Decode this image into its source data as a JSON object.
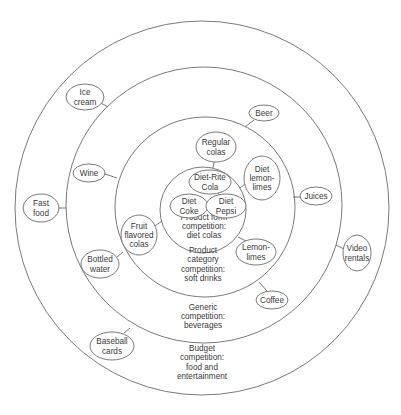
{
  "diagram": {
    "colors": {
      "line": "#6b6b6b",
      "text": "#3a3a3a",
      "background": "#ffffff"
    },
    "rings": [
      {
        "id": "budget",
        "cx": 202,
        "cy": 208,
        "r": 187,
        "label_lines": [
          "Budget",
          "competition:",
          "food and",
          "entertainment"
        ],
        "label_x": 202,
        "label_y": 362
      },
      {
        "id": "generic",
        "cx": 204,
        "cy": 205,
        "r": 138,
        "label_lines": [
          "Generic",
          "competition:",
          "beverages"
        ],
        "label_x": 203,
        "label_y": 316
      },
      {
        "id": "product-category",
        "cx": 205,
        "cy": 207,
        "r": 90,
        "label_lines": [
          "Product",
          "category",
          "competition:",
          "soft drinks"
        ],
        "label_x": 203,
        "label_y": 264
      },
      {
        "id": "product-form",
        "cx": 203,
        "cy": 210,
        "r": 43,
        "label_lines": [
          "Product form",
          "competition:",
          "diet colas"
        ],
        "label_x": 204,
        "label_y": 226
      }
    ],
    "nodes": [
      {
        "id": "ice-cream",
        "lines": [
          "Ice",
          "cream"
        ],
        "cx": 85,
        "cy": 97,
        "rx": 19,
        "ry": 13,
        "link": [
          101,
          103,
          108,
          107
        ]
      },
      {
        "id": "wine",
        "lines": [
          "Wine"
        ],
        "cx": 89,
        "cy": 173,
        "rx": 16,
        "ry": 9,
        "link": [
          105,
          174,
          117,
          178
        ]
      },
      {
        "id": "fast-food",
        "lines": [
          "Fast",
          "food"
        ],
        "cx": 41,
        "cy": 208,
        "rx": 18,
        "ry": 14,
        "link": [
          59,
          208,
          66,
          208
        ]
      },
      {
        "id": "beer",
        "lines": [
          "Beer"
        ],
        "cx": 264,
        "cy": 113,
        "rx": 15,
        "ry": 8,
        "link": [
          254,
          120,
          245,
          127
        ]
      },
      {
        "id": "regular-colas",
        "lines": [
          "Regular",
          "colas"
        ],
        "cx": 216,
        "cy": 147,
        "rx": 20,
        "ry": 15,
        "link": [
          214,
          162,
          213,
          168
        ]
      },
      {
        "id": "diet-lemon-limes",
        "lines": [
          "Diet",
          "lemon-",
          "limes"
        ],
        "cx": 262,
        "cy": 178,
        "rx": 18,
        "ry": 22,
        "link": [
          245,
          184,
          240,
          188
        ]
      },
      {
        "id": "juices",
        "lines": [
          "Juices"
        ],
        "cx": 316,
        "cy": 196,
        "rx": 16,
        "ry": 9,
        "link": [
          300,
          197,
          293,
          197
        ]
      },
      {
        "id": "diet-rite-cola",
        "lines": [
          "Diet-Rite",
          "Cola"
        ],
        "cx": 210,
        "cy": 182,
        "rx": 21,
        "ry": 12,
        "link": null
      },
      {
        "id": "diet-coke",
        "lines": [
          "Diet",
          "Coke"
        ],
        "cx": 189,
        "cy": 206,
        "rx": 19,
        "ry": 12,
        "link": [
          208,
          206,
          206,
          206
        ]
      },
      {
        "id": "diet-pepsi",
        "lines": [
          "Diet",
          "Pepsi"
        ],
        "cx": 226,
        "cy": 206,
        "rx": 20,
        "ry": 12,
        "link": [
          218,
          194,
          221,
          195
        ]
      },
      {
        "id": "fruit-flavored-colas",
        "lines": [
          "Fruit",
          "flavored",
          "colas"
        ],
        "cx": 139,
        "cy": 235,
        "rx": 18,
        "ry": 20,
        "link": [
          155,
          226,
          162,
          221
        ]
      },
      {
        "id": "bottled-water",
        "lines": [
          "Bottled",
          "water"
        ],
        "cx": 100,
        "cy": 264,
        "rx": 19,
        "ry": 14,
        "link": [
          117,
          257,
          123,
          252
        ]
      },
      {
        "id": "lemon-limes",
        "lines": [
          "Lemon-",
          "limes"
        ],
        "cx": 256,
        "cy": 252,
        "rx": 20,
        "ry": 13,
        "link": [
          246,
          241,
          238,
          237
        ]
      },
      {
        "id": "coffee",
        "lines": [
          "Coffee"
        ],
        "cx": 272,
        "cy": 300,
        "rx": 16,
        "ry": 9,
        "link": [
          267,
          291,
          259,
          282
        ]
      },
      {
        "id": "video-rentals",
        "lines": [
          "Video",
          "rentals"
        ],
        "cx": 357,
        "cy": 253,
        "rx": 14,
        "ry": 18,
        "link": [
          344,
          249,
          336,
          245
        ]
      },
      {
        "id": "baseball-cards",
        "lines": [
          "Baseball",
          "cards"
        ],
        "cx": 112,
        "cy": 346,
        "rx": 22,
        "ry": 14,
        "link": [
          124,
          333,
          130,
          328
        ]
      }
    ]
  }
}
